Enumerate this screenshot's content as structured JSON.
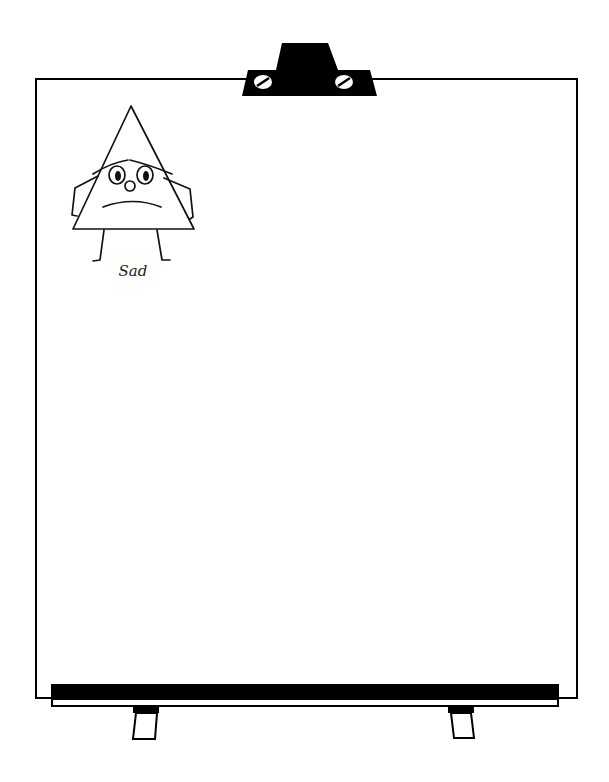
{
  "drawing": {
    "title": "Sad",
    "character": {
      "shape": "triangle",
      "emotion": "sad",
      "label": "Sad"
    },
    "board": {
      "type": "easel-whiteboard",
      "border_color": "#000000",
      "fill_color": "#ffffff"
    }
  }
}
